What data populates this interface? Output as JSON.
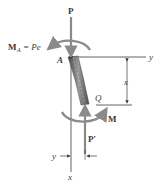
{
  "diagram": {
    "labels": {
      "force_top": "P",
      "moment_top_lhs": "M",
      "moment_top_sub": "A",
      "moment_top_eq": "= Pe",
      "point_a": "A",
      "point_q": "Q",
      "axis_y_top": "y",
      "dim_x": "x",
      "moment_bottom": "M",
      "force_bottom": "P′",
      "axis_y_bottom": "y",
      "axis_x_bottom": "x"
    },
    "colors": {
      "arrow": "#8a8a8a",
      "line": "#3a3a3a",
      "column_dark": "#5a5a5a",
      "column_light": "#b0b0b0",
      "text": "#3a3a3a"
    }
  }
}
